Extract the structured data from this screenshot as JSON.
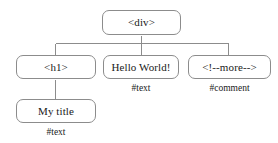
{
  "diagram": {
    "background_color": "#ffffff",
    "stroke_color": "#8c8c8c",
    "text_color": "#1a1a1a",
    "nodes": [
      {
        "id": "div",
        "label": "<div>",
        "caption": ""
      },
      {
        "id": "h1",
        "label": "<h1>",
        "caption": ""
      },
      {
        "id": "hello",
        "label": "Hello World!",
        "caption": "#text"
      },
      {
        "id": "comment",
        "label": "<!--more-->",
        "caption": "#comment"
      },
      {
        "id": "mytitle",
        "label": "My title",
        "caption": "#text"
      }
    ]
  }
}
